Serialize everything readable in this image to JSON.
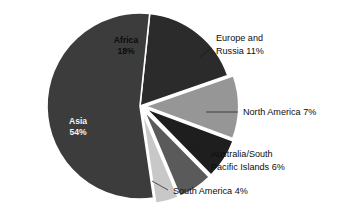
{
  "chart_data": {
    "type": "pie",
    "title": "",
    "subtitle": "",
    "xlabel": "",
    "ylabel": "",
    "legend_position": "none",
    "grid": false,
    "units": "percent",
    "total": 100,
    "categories": [
      "Africa",
      "Europe and Russia",
      "North America",
      "Australia/South Pacific Islands",
      "South America",
      "Asia"
    ],
    "values": [
      18,
      11,
      7,
      6,
      4,
      54
    ],
    "slices": [
      {
        "name": "Africa",
        "value": 18,
        "value_text": "18%",
        "label_line1": "Africa",
        "label_line2": "18%",
        "label_placement": "inside",
        "label_color": "dark",
        "color": "#2b2b2b",
        "exploded": false,
        "start_deg": -84,
        "end_deg": -19.2
      },
      {
        "name": "Europe and Russia",
        "value": 11,
        "value_text": "11%",
        "callout_line1": "Europe and",
        "callout_line2": "Russia 11%",
        "label_placement": "callout",
        "color": "#969696",
        "exploded": true,
        "start_deg": -19.2,
        "end_deg": 20.4
      },
      {
        "name": "North America",
        "value": 7,
        "value_text": "7%",
        "callout_line1": "North America 7%",
        "callout_line2": "",
        "label_placement": "callout",
        "color": "#1e1e1e",
        "exploded": true,
        "start_deg": 20.4,
        "end_deg": 45.6
      },
      {
        "name": "Australia/South Pacific Islands",
        "value": 6,
        "value_text": "6%",
        "callout_line1": "Australia/South",
        "callout_line2": "Pacific Islands 6%",
        "label_placement": "callout",
        "color": "#5a5a5a",
        "exploded": true,
        "start_deg": 45.6,
        "end_deg": 67.2
      },
      {
        "name": "South America",
        "value": 4,
        "value_text": "4%",
        "callout_line1": "South America 4%",
        "callout_line2": "",
        "label_placement": "callout",
        "color": "#c8c8c8",
        "exploded": true,
        "start_deg": 67.2,
        "end_deg": 81.6
      },
      {
        "name": "Asia",
        "value": 54,
        "value_text": "54%",
        "label_line1": "Asia",
        "label_line2": "54%",
        "label_placement": "inside",
        "label_color": "light",
        "color": "#3c3c3c",
        "exploded": false,
        "start_deg": 81.6,
        "end_deg": 276
      }
    ],
    "colors": {
      "africa": "#2b2b2b",
      "europe_russia": "#969696",
      "north_america": "#1e1e1e",
      "australia_pacific": "#5a5a5a",
      "south_america": "#c8c8c8",
      "asia": "#3c3c3c",
      "background": "#ffffff",
      "slice_border": "#ffffff",
      "text": "#0d0d0d"
    }
  }
}
